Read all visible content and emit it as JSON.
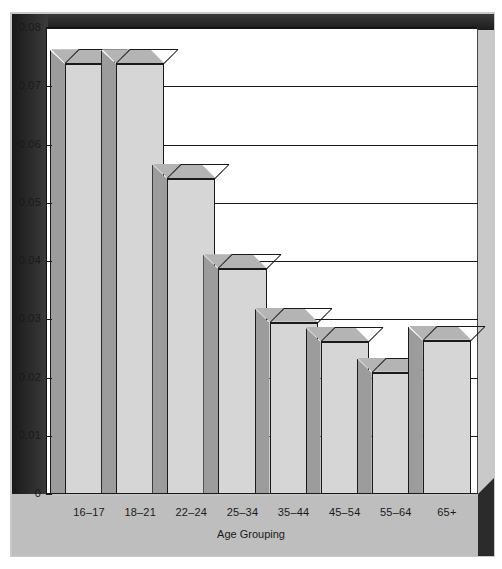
{
  "chart_data": {
    "type": "bar",
    "title": "",
    "xlabel": "Age Grouping",
    "ylabel": "Percent",
    "categories": [
      "16–17",
      "18–21",
      "22–24",
      "25–34",
      "35–44",
      "45–54",
      "55–64",
      "65+"
    ],
    "values": [
      0.0738,
      0.0738,
      0.0541,
      0.0386,
      0.0294,
      0.0261,
      0.0208,
      0.0263
    ],
    "ylim": [
      0,
      0.08
    ],
    "ytick_labels": [
      "0",
      "0.01",
      "0.02",
      "0.03",
      "0.04",
      "0.05",
      "0.06",
      "0.07",
      "0.08"
    ],
    "ytick_values": [
      0,
      0.01,
      0.02,
      0.03,
      0.04,
      0.05,
      0.06,
      0.07,
      0.08
    ],
    "grid": true,
    "legend": "none",
    "style": "3d-bars",
    "colors": {
      "bar_front": "#d6d6d6",
      "bar_side": "#9c9c9c",
      "bar_top": "#b4b4b4",
      "outline": "#1a1a1a",
      "plot_background": "#ffffff",
      "floor": "#bfbfbf",
      "wall": "#2b2b2b",
      "page_background": "#ffffff"
    }
  }
}
